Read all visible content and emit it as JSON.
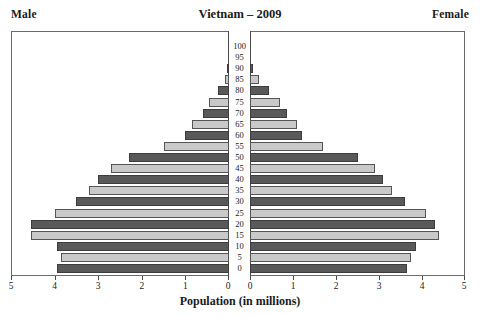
{
  "header": {
    "title": "Vietnam – 2009",
    "male_label": "Male",
    "female_label": "Female"
  },
  "axis": {
    "xlabel": "Population (in millions)",
    "xticks": [
      0,
      1,
      2,
      3,
      4,
      5
    ],
    "xtick_labels": [
      "0",
      "1",
      "2",
      "3",
      "4",
      "5"
    ],
    "xmax": 5,
    "age_labels": [
      "0",
      "5",
      "10",
      "15",
      "20",
      "25",
      "30",
      "35",
      "40",
      "45",
      "50",
      "55",
      "60",
      "65",
      "70",
      "75",
      "80",
      "85",
      "90",
      "95",
      "100"
    ]
  },
  "colors": {
    "dark_bar": "#595959",
    "light_bar": "#c9c9c9",
    "frame": "#6b6b6b",
    "text": "#1a1a1a",
    "background": "#ffffff"
  },
  "chart_data": {
    "type": "bar",
    "title": "Vietnam – 2009",
    "subtitle": "",
    "xlabel": "Population (in millions)",
    "ylabel": "Age",
    "orientation": "horizontal",
    "layout": "population-pyramid",
    "grid": false,
    "legend": "none",
    "xlim": [
      0,
      5
    ],
    "categories": [
      "0",
      "5",
      "10",
      "15",
      "20",
      "25",
      "30",
      "35",
      "40",
      "45",
      "50",
      "55",
      "60",
      "65",
      "70",
      "75",
      "80",
      "85",
      "90",
      "95",
      "100"
    ],
    "series": [
      {
        "name": "Male",
        "side": "left",
        "values": [
          3.95,
          3.85,
          3.95,
          4.55,
          4.55,
          4.0,
          3.5,
          3.2,
          3.0,
          2.7,
          2.3,
          1.5,
          1.0,
          0.85,
          0.6,
          0.45,
          0.25,
          0.1,
          0.05,
          0.0,
          0.0
        ]
      },
      {
        "name": "Female",
        "side": "right",
        "values": [
          3.65,
          3.75,
          3.85,
          4.4,
          4.3,
          4.1,
          3.6,
          3.3,
          3.1,
          2.9,
          2.5,
          1.7,
          1.2,
          1.1,
          0.85,
          0.7,
          0.45,
          0.2,
          0.07,
          0.0,
          0.0
        ]
      }
    ],
    "bar_shades": [
      "dark",
      "light",
      "dark",
      "light",
      "dark",
      "light",
      "dark",
      "light",
      "dark",
      "light",
      "dark",
      "light",
      "dark",
      "light",
      "dark",
      "light",
      "dark",
      "light",
      "dark",
      "light",
      "dark"
    ]
  }
}
